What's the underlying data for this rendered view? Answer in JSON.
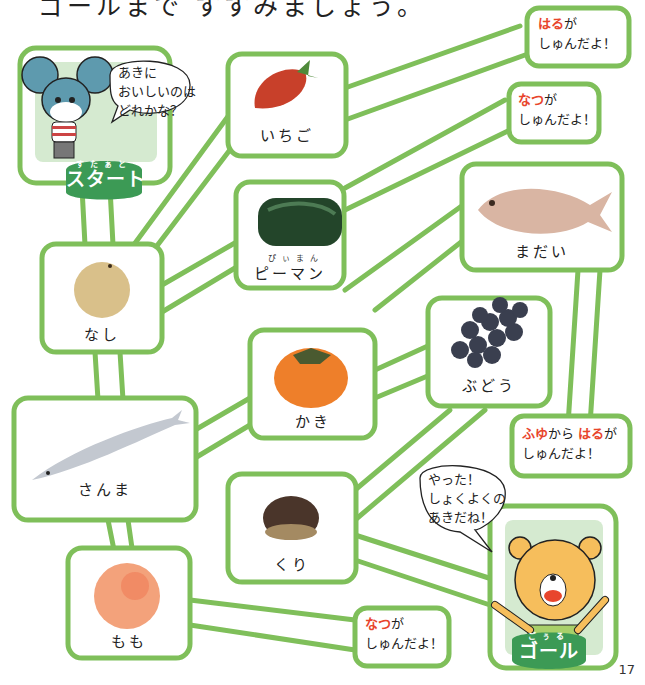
{
  "title": "ゴールまで すすみましょう。",
  "page_number": "17",
  "colors": {
    "path_stroke": "#7fbf5a",
    "path_shade": "#cde6bd",
    "badge_bg": "#3c9a55",
    "highlight": "#e8452c",
    "panel_bg": "#d5ead0"
  },
  "start": {
    "badge_ruby": "すたぁと",
    "badge_label": "スタート",
    "character": "mouse",
    "speech": [
      "あきに",
      "おいしいのは",
      "どれかな？"
    ]
  },
  "goal": {
    "badge_ruby": "ごぅる",
    "badge_label": "ゴール",
    "character": "bear",
    "speech": [
      "やった！",
      "しょくよくの",
      "あきだね！"
    ]
  },
  "foods": [
    {
      "id": "ichigo",
      "label": "いちご",
      "icon": "strawberry-icon"
    },
    {
      "id": "piman",
      "label": "ピーマン",
      "ruby": "ぴぃまん",
      "icon": "green-pepper-icon"
    },
    {
      "id": "madai",
      "label": "まだい",
      "icon": "sea-bream-icon"
    },
    {
      "id": "nashi",
      "label": "なし",
      "icon": "pear-icon"
    },
    {
      "id": "kaki",
      "label": "かき",
      "icon": "persimmon-icon"
    },
    {
      "id": "budou",
      "label": "ぶどう",
      "icon": "grapes-icon"
    },
    {
      "id": "sanma",
      "label": "さんま",
      "icon": "saury-icon"
    },
    {
      "id": "kuri",
      "label": "くり",
      "icon": "chestnut-icon"
    },
    {
      "id": "momo",
      "label": "もも",
      "icon": "peach-icon"
    }
  ],
  "season_notes": [
    {
      "for": "ichigo",
      "season": "はる",
      "suffix": "が",
      "line2": "しゅんだよ！"
    },
    {
      "for": "piman",
      "season": "なつ",
      "suffix": "が",
      "line2": "しゅんだよ！"
    },
    {
      "for": "madai",
      "season": "ふゆ",
      "mid": "から",
      "season2": "はる",
      "suffix": "が",
      "line2": "しゅんだよ！"
    },
    {
      "for": "momo",
      "season": "なつ",
      "suffix": "が",
      "line2": "しゅんだよ！"
    }
  ]
}
